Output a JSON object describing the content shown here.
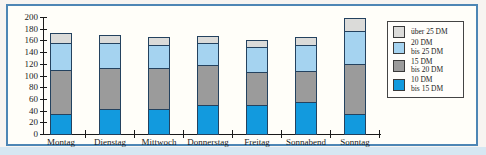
{
  "chart_data": {
    "type": "bar",
    "stacked": true,
    "title": "",
    "xlabel": "",
    "ylabel": "",
    "categories": [
      "Montag",
      "Dienstag",
      "Mittwoch",
      "Donnerstag",
      "Freitag",
      "Sonnabend",
      "Sonntag"
    ],
    "series": [
      {
        "name": "10 DM bis 15 DM",
        "legend_lines": [
          "10 DM",
          "bis 15 DM"
        ],
        "color": "#129ade",
        "values": [
          35,
          43,
          43,
          50,
          50,
          55,
          34
        ]
      },
      {
        "name": "15 DM bis 20 DM",
        "legend_lines": [
          "15 DM",
          "bis 20 DM"
        ],
        "color": "#9b9b9b",
        "values": [
          75,
          70,
          70,
          68,
          56,
          52,
          86
        ]
      },
      {
        "name": "20 DM bis 25 DM",
        "legend_lines": [
          "20 DM",
          "bis 25 DM"
        ],
        "color": "#a5d3f0",
        "values": [
          45,
          42,
          39,
          37,
          42,
          45,
          56
        ]
      },
      {
        "name": "über 25 DM",
        "legend_lines": [
          "über 25 DM"
        ],
        "color": "#dbdbd9",
        "values": [
          18,
          15,
          13,
          12,
          13,
          13,
          23
        ]
      }
    ],
    "totals": [
      173,
      170,
      165,
      167,
      161,
      165,
      199
    ],
    "ylim": [
      0,
      200
    ],
    "ytick_step": 20,
    "grid": false,
    "legend_position": "top-right",
    "legend_order_top_to_bottom": [
      "über 25 DM",
      "20 DM bis 25 DM",
      "15 DM bis 20 DM",
      "10 DM bis 15 DM"
    ],
    "axis_color": "#1a1a1a",
    "bar_outline_color": "#24425f",
    "frame_border_color": "#4d86b5"
  }
}
